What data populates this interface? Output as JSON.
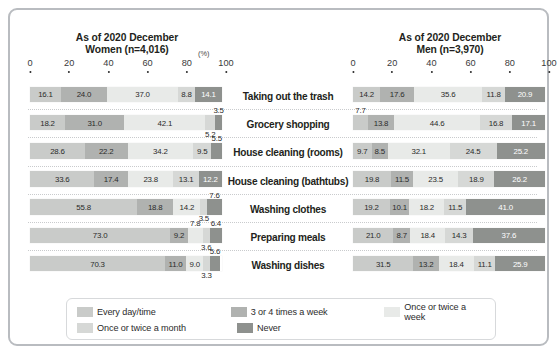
{
  "panels": {
    "women": {
      "title_line1": "As of 2020 December",
      "title_line2": "Women (n=4,016)"
    },
    "men": {
      "title_line1": "As of 2020 December",
      "title_line2": "Men (n=3,970)"
    }
  },
  "axis": {
    "ticks": [
      "0",
      "20",
      "40",
      "60",
      "80",
      "100"
    ],
    "unit": "(%)",
    "min": 0,
    "max": 100
  },
  "legend": {
    "items": [
      {
        "label": "Every day/time",
        "color": "#c9cbc9"
      },
      {
        "label": "3 or 4 times a week",
        "color": "#b0b2b0"
      },
      {
        "label": "Once or twice a week",
        "color": "#e8eae8"
      },
      {
        "label": "Once or twice a month",
        "color": "#d6d8d6"
      },
      {
        "label": "Never",
        "color": "#8e918e"
      }
    ]
  },
  "chart_data": {
    "type": "bar",
    "orientation": "horizontal",
    "stacked": true,
    "normalized": true,
    "xlabel": "(%)",
    "ylabel": "",
    "xlim": [
      0,
      100
    ],
    "grid": false,
    "legend_position": "bottom",
    "categories": [
      "Taking out the trash",
      "Grocery shopping",
      "House cleaning (rooms)",
      "House cleaning (bathtubs)",
      "Washing clothes",
      "Preparing meals",
      "Washing dishes"
    ],
    "series_names": [
      "Every day/time",
      "3 or 4 times a week",
      "Once or twice a week",
      "Once or twice a month",
      "Never"
    ],
    "panels": [
      {
        "name": "Women",
        "n": 4016,
        "as_of": "2020 December",
        "series": [
          {
            "name": "Every day/time",
            "values": [
              16.1,
              18.2,
              28.6,
              33.6,
              55.8,
              73.0,
              70.3
            ]
          },
          {
            "name": "3 or 4 times a week",
            "values": [
              24.0,
              31.0,
              22.2,
              17.4,
              18.8,
              9.2,
              11.0
            ]
          },
          {
            "name": "Once or twice a week",
            "values": [
              37.0,
              42.1,
              34.2,
              23.8,
              14.2,
              7.8,
              9.0
            ]
          },
          {
            "name": "Once or twice a month",
            "values": [
              8.8,
              5.2,
              9.5,
              13.1,
              3.5,
              3.6,
              3.3
            ]
          },
          {
            "name": "Never",
            "values": [
              14.1,
              3.5,
              5.5,
              12.2,
              7.6,
              6.4,
              5.6
            ]
          }
        ]
      },
      {
        "name": "Men",
        "n": 3970,
        "as_of": "2020 December",
        "series": [
          {
            "name": "Every day/time",
            "values": [
              14.2,
              7.7,
              9.7,
              19.8,
              19.2,
              21.0,
              31.5
            ]
          },
          {
            "name": "3 or 4 times a week",
            "values": [
              17.6,
              13.8,
              8.5,
              11.5,
              10.1,
              8.7,
              13.2
            ]
          },
          {
            "name": "Once or twice a week",
            "values": [
              35.6,
              44.6,
              32.1,
              23.5,
              18.2,
              18.4,
              18.4
            ]
          },
          {
            "name": "Once or twice a month",
            "values": [
              11.8,
              16.8,
              24.5,
              18.9,
              11.5,
              14.3,
              11.1
            ]
          },
          {
            "name": "Never",
            "values": [
              20.9,
              17.1,
              25.2,
              26.2,
              41.0,
              37.6,
              25.9
            ]
          }
        ]
      }
    ]
  }
}
